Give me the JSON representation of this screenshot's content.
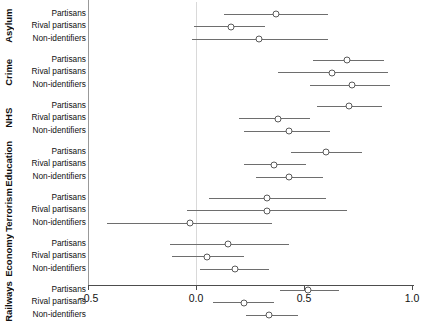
{
  "chart_data": {
    "type": "scatter",
    "subtype": "forest-plot-coefficient-plot",
    "title": "",
    "xlabel": "",
    "ylabel": "",
    "xlim": [
      -0.62,
      1.09
    ],
    "xticks": [
      -0.5,
      0.0,
      0.5,
      1.0
    ],
    "xticklabels": [
      "−0.5",
      "0.0",
      "0.5",
      "1.0"
    ],
    "grid": false,
    "legend": null,
    "reference_line": 0.0,
    "marker": "open-circle",
    "categories": [
      "Partisans",
      "Rival partisans",
      "Non-identifiers"
    ],
    "groups": [
      {
        "name": "Asylum",
        "rows": [
          {
            "label": "Partisans",
            "estimate": 0.37,
            "ci_low": 0.13,
            "ci_high": 0.61
          },
          {
            "label": "Rival partisans",
            "estimate": 0.16,
            "ci_low": -0.01,
            "ci_high": 0.32
          },
          {
            "label": "Non-identifiers",
            "estimate": 0.29,
            "ci_low": -0.02,
            "ci_high": 0.61
          }
        ]
      },
      {
        "name": "Crime",
        "rows": [
          {
            "label": "Partisans",
            "estimate": 0.7,
            "ci_low": 0.54,
            "ci_high": 0.87
          },
          {
            "label": "Rival partisans",
            "estimate": 0.63,
            "ci_low": 0.38,
            "ci_high": 0.89
          },
          {
            "label": "Non-identifiers",
            "estimate": 0.72,
            "ci_low": 0.53,
            "ci_high": 0.9
          }
        ]
      },
      {
        "name": "NHS",
        "rows": [
          {
            "label": "Partisans",
            "estimate": 0.71,
            "ci_low": 0.56,
            "ci_high": 0.86
          },
          {
            "label": "Rival partisans",
            "estimate": 0.38,
            "ci_low": 0.2,
            "ci_high": 0.53
          },
          {
            "label": "Non-identifiers",
            "estimate": 0.43,
            "ci_low": 0.22,
            "ci_high": 0.62
          }
        ]
      },
      {
        "name": "Education",
        "rows": [
          {
            "label": "Partisans",
            "estimate": 0.6,
            "ci_low": 0.44,
            "ci_high": 0.77
          },
          {
            "label": "Rival partisans",
            "estimate": 0.36,
            "ci_low": 0.22,
            "ci_high": 0.51
          },
          {
            "label": "Non-identifiers",
            "estimate": 0.43,
            "ci_low": 0.28,
            "ci_high": 0.59
          }
        ]
      },
      {
        "name": "Terrorism",
        "rows": [
          {
            "label": "Partisans",
            "estimate": 0.33,
            "ci_low": 0.06,
            "ci_high": 0.6
          },
          {
            "label": "Rival partisans",
            "estimate": 0.33,
            "ci_low": -0.04,
            "ci_high": 0.7
          },
          {
            "label": "Non-identifiers",
            "estimate": -0.03,
            "ci_low": -0.41,
            "ci_high": 0.35
          }
        ]
      },
      {
        "name": "Economy",
        "rows": [
          {
            "label": "Partisans",
            "estimate": 0.15,
            "ci_low": -0.12,
            "ci_high": 0.43
          },
          {
            "label": "Rival partisans",
            "estimate": 0.05,
            "ci_low": -0.11,
            "ci_high": 0.22
          },
          {
            "label": "Non-identifiers",
            "estimate": 0.18,
            "ci_low": 0.02,
            "ci_high": 0.34
          }
        ]
      },
      {
        "name": "Railways",
        "rows": [
          {
            "label": "Partisans",
            "estimate": 0.52,
            "ci_low": 0.39,
            "ci_high": 0.66
          },
          {
            "label": "Rival partisans",
            "estimate": 0.22,
            "ci_low": 0.08,
            "ci_high": 0.36
          },
          {
            "label": "Non-identifiers",
            "estimate": 0.34,
            "ci_low": 0.23,
            "ci_high": 0.47
          }
        ]
      }
    ]
  },
  "colors": {
    "line": "#6e6e6e",
    "marker_edge": "#5a5a5a",
    "marker_fill": "#ffffff",
    "axis": "#4d4d4d",
    "reference_line": "#d9d9d9",
    "text": "#111111",
    "background": "#ffffff"
  }
}
